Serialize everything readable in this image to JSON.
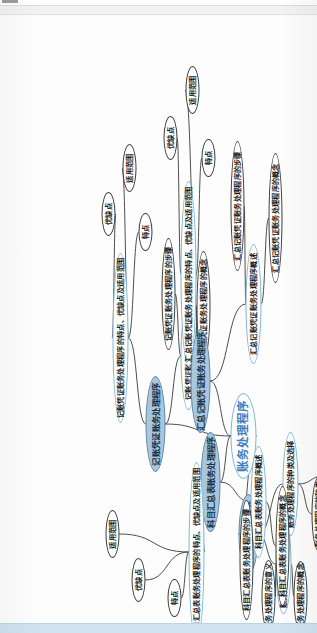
{
  "app": {
    "title": "账务处理程序",
    "orientation": "rotated-90-ccw",
    "colors": {
      "branch_fill": "#a9c6dd",
      "branch_stroke": "#5d89a8",
      "level2_stroke": "#7fb4d4",
      "leaf_stroke": "#3b3b3b",
      "root_text": "#3f7fbf",
      "bottom_bar": "#cfe2ee",
      "canvas": "#fdfdfd"
    }
  },
  "root": {
    "label": "账务处理程序"
  },
  "branches": [
    {
      "label": "账务处理程序概述",
      "children": [
        {
          "label": "账务处理程序的概念与意义",
          "children": [
            {
              "label": "账务处理程序的意义"
            },
            {
              "label": "账务处理程序的概念"
            }
          ]
        },
        {
          "label": "账务处理程序的种类及选择",
          "children": [
            {
              "label": "账务处理程序的种类"
            },
            {
              "label": "设置账务处理程序的要求"
            }
          ]
        }
      ]
    },
    {
      "label": "记账凭证账务处理程序",
      "children": [
        {
          "label": "记账凭证账务处理程序概述",
          "children": [
            {
              "label": "记账凭证账务处理程序的概念"
            },
            {
              "label": "记账凭证账务处理程序的步骤"
            }
          ]
        },
        {
          "label": "记账凭证账务处理程序的特点、优缺点及适用范围",
          "children": [
            {
              "label": "特点"
            },
            {
              "label": "优缺点"
            },
            {
              "label": "适用范围"
            }
          ]
        }
      ]
    },
    {
      "label": "汇总记账凭证账务处理程序",
      "children": [
        {
          "label": "汇总记账凭证账务处理程序概述",
          "children": [
            {
              "label": "汇总记账凭证账务处理程序的概念"
            },
            {
              "label": "汇总记账凭证账务处理程序的步骤"
            }
          ]
        },
        {
          "label": "汇总记账凭证账务处理程序的特点、优缺点及适用范围",
          "children": [
            {
              "label": "特点"
            },
            {
              "label": "优缺点"
            },
            {
              "label": "适用范围"
            }
          ]
        }
      ]
    },
    {
      "label": "科目汇总表账务处理程序",
      "children": [
        {
          "label": "科目汇总表账务处理程序概述",
          "children": [
            {
              "label": "科目汇总表账务处理程序的概念"
            },
            {
              "label": "科目汇总表账务处理程序的步骤"
            }
          ]
        },
        {
          "label": "科目汇总表账务处理程序的特点、优缺点及适用范围",
          "children": [
            {
              "label": "特点"
            },
            {
              "label": "优缺点"
            },
            {
              "label": "适用范围"
            }
          ]
        }
      ]
    }
  ]
}
